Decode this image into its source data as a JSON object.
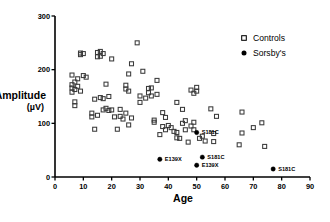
{
  "chart_data": {
    "type": "scatter",
    "title": "",
    "xlabel": "Age",
    "ylabel": "Amplitude",
    "ylabel_units": "(µV)",
    "xlim": [
      0,
      90
    ],
    "ylim": [
      0,
      300
    ],
    "xticks": [
      0,
      10,
      20,
      30,
      40,
      50,
      60,
      70,
      80,
      90
    ],
    "yticks": [
      0,
      100,
      200,
      300
    ],
    "xtick_labels": [
      "0",
      "10",
      "20",
      "30",
      "40",
      "50",
      "60",
      "70",
      "80",
      "90"
    ],
    "ytick_labels": [
      "0",
      "100",
      "200",
      "300"
    ],
    "grid": false,
    "legend_position": "top-right",
    "legend": [
      {
        "name": "Controls",
        "marker": "open-square"
      },
      {
        "name": "Sorsby's",
        "marker": "filled-circle"
      }
    ],
    "series": [
      {
        "name": "Controls",
        "marker": "open-square",
        "points": [
          [
            6,
            190
          ],
          [
            6,
            172
          ],
          [
            6,
            166
          ],
          [
            6,
            158
          ],
          [
            7,
            177
          ],
          [
            7,
            163
          ],
          [
            7,
            140
          ],
          [
            7,
            133
          ],
          [
            8,
            183
          ],
          [
            8,
            169
          ],
          [
            9,
            231
          ],
          [
            9,
            228
          ],
          [
            9,
            160
          ],
          [
            10,
            230
          ],
          [
            10,
            189
          ],
          [
            11,
            186
          ],
          [
            13,
            119
          ],
          [
            13,
            112
          ],
          [
            14,
            89
          ],
          [
            14,
            145
          ],
          [
            15,
            232
          ],
          [
            15,
            224
          ],
          [
            15,
            115
          ],
          [
            16,
            234
          ],
          [
            16,
            225
          ],
          [
            16,
            148
          ],
          [
            17,
            230
          ],
          [
            17,
            146
          ],
          [
            17,
            125
          ],
          [
            18,
            173
          ],
          [
            18,
            128
          ],
          [
            19,
            150
          ],
          [
            19,
            124
          ],
          [
            20,
            220
          ],
          [
            20,
            125
          ],
          [
            21,
            112
          ],
          [
            22,
            89
          ],
          [
            23,
            126
          ],
          [
            23,
            113
          ],
          [
            24,
            108
          ],
          [
            25,
            171
          ],
          [
            25,
            164
          ],
          [
            25,
            119
          ],
          [
            26,
            192
          ],
          [
            26,
            160
          ],
          [
            26,
            97
          ],
          [
            27,
            211
          ],
          [
            27,
            110
          ],
          [
            29,
            250
          ],
          [
            30,
            151
          ],
          [
            30,
            139
          ],
          [
            31,
            197
          ],
          [
            32,
            147
          ],
          [
            33,
            165
          ],
          [
            33,
            157
          ],
          [
            34,
            166
          ],
          [
            34,
            151
          ],
          [
            35,
            106
          ],
          [
            35,
            102
          ],
          [
            36,
            180
          ],
          [
            36,
            154
          ],
          [
            37,
            79
          ],
          [
            38,
            120
          ],
          [
            38,
            94
          ],
          [
            39,
            111
          ],
          [
            39,
            88
          ],
          [
            40,
            96
          ],
          [
            41,
            92
          ],
          [
            42,
            85
          ],
          [
            43,
            139
          ],
          [
            43,
            83
          ],
          [
            43,
            73
          ],
          [
            44,
            72
          ],
          [
            45,
            126
          ],
          [
            45,
            100
          ],
          [
            46,
            88
          ],
          [
            46,
            105
          ],
          [
            47,
            65
          ],
          [
            48,
            162
          ],
          [
            48,
            95
          ],
          [
            49,
            156
          ],
          [
            49,
            102
          ],
          [
            49,
            88
          ],
          [
            50,
            167
          ],
          [
            50,
            160
          ],
          [
            51,
            72
          ],
          [
            52,
            76
          ],
          [
            53,
            67
          ],
          [
            55,
            127
          ],
          [
            56,
            81
          ],
          [
            56,
            66
          ],
          [
            57,
            113
          ],
          [
            65,
            60
          ],
          [
            66,
            121
          ],
          [
            66,
            82
          ],
          [
            70,
            92
          ],
          [
            73,
            101
          ],
          [
            74,
            57
          ]
        ]
      },
      {
        "name": "Sorsby's",
        "marker": "filled-circle",
        "points": [
          {
            "x": 37,
            "y": 33,
            "label": "E139X",
            "label_side": "right"
          },
          {
            "x": 50,
            "y": 22,
            "label": "E139X",
            "label_side": "right"
          },
          {
            "x": 52,
            "y": 37,
            "label": "S181C",
            "label_side": "right"
          },
          {
            "x": 50,
            "y": 83,
            "label": "S181C",
            "label_side": "right"
          },
          {
            "x": 77,
            "y": 15,
            "label": "S181C",
            "label_side": "right"
          }
        ]
      }
    ]
  },
  "colors": {
    "axis": "#000000",
    "controls_marker": "#3a3a3a",
    "sorsbys_marker": "#000000",
    "background": "#ffffff"
  }
}
